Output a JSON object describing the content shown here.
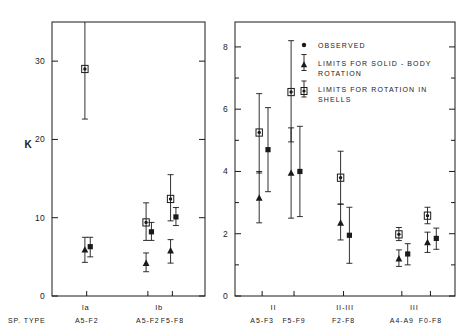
{
  "figure": {
    "y_axis_title": "K",
    "sp_type_label": "SP. TYPE"
  },
  "legend": {
    "entries": [
      {
        "marker": "observed-dot-icon",
        "label": "OBSERVED"
      },
      {
        "marker": "triangle-icon",
        "label": "LIMITS FOR SOLID - BODY"
      },
      {
        "marker": "",
        "label": "ROTATION"
      },
      {
        "marker": "circle-dot-icon",
        "label": "LIMITS FOR ROTATION  IN"
      },
      {
        "marker": "",
        "label": "SHELLS"
      }
    ]
  },
  "chart_data": [
    {
      "type": "scatter",
      "panel": "left",
      "title": "",
      "xlabel": "SP. TYPE",
      "ylabel": "K",
      "ylim": [
        0,
        35
      ],
      "yticks": [
        0,
        10,
        20,
        30
      ],
      "ytick_labels": [
        "0",
        "10",
        "20",
        "30"
      ],
      "grid": false,
      "legend_position": "none",
      "luminosity_groups": [
        {
          "name": "Ia",
          "x_center": 0.22,
          "spectral_ranges": [
            "A5-F2"
          ]
        },
        {
          "name": "Ib",
          "x_center": 0.7,
          "spectral_ranges": [
            "A5-F2",
            "F5-F8"
          ]
        }
      ],
      "series": [
        {
          "name": "LIMITS FOR ROTATION IN SHELLS",
          "marker": "circle-dot",
          "points": [
            {
              "group": "Ia",
              "sp": "A5-F2",
              "x": 0.215,
              "y": 29.0,
              "lo": 22.6,
              "hi": 35.0
            },
            {
              "group": "Ib",
              "sp": "A5-F2",
              "x": 0.615,
              "y": 9.4,
              "lo": 7.1,
              "hi": 11.9
            },
            {
              "group": "Ib",
              "sp": "F5-F8",
              "x": 0.775,
              "y": 12.4,
              "lo": 9.6,
              "hi": 15.5
            }
          ]
        },
        {
          "name": "OBSERVED",
          "marker": "filled-square",
          "points": [
            {
              "group": "Ia",
              "sp": "A5-F2",
              "x": 0.25,
              "y": 6.3,
              "lo": 5.0,
              "hi": 7.5
            },
            {
              "group": "Ib",
              "sp": "A5-F2",
              "x": 0.65,
              "y": 8.2,
              "lo": 7.1,
              "hi": 9.4
            },
            {
              "group": "Ib",
              "sp": "F5-F8",
              "x": 0.81,
              "y": 10.1,
              "lo": 9.0,
              "hi": 11.3
            }
          ]
        },
        {
          "name": "LIMITS FOR SOLID-BODY ROTATION",
          "marker": "triangle",
          "points": [
            {
              "group": "Ia",
              "sp": "A5-F2",
              "x": 0.215,
              "y": 5.9,
              "lo": 4.3,
              "hi": 7.5
            },
            {
              "group": "Ib",
              "sp": "A5-F2",
              "x": 0.615,
              "y": 4.2,
              "lo": 3.1,
              "hi": 5.5
            },
            {
              "group": "Ib",
              "sp": "F5-F8",
              "x": 0.775,
              "y": 5.8,
              "lo": 4.2,
              "hi": 7.2
            }
          ]
        }
      ]
    },
    {
      "type": "scatter",
      "panel": "right",
      "title": "",
      "xlabel": "SP. TYPE",
      "ylabel": "",
      "ylim": [
        0,
        8.8
      ],
      "yticks": [
        0,
        2,
        4,
        6,
        8
      ],
      "ytick_labels": [
        "0",
        "2",
        "4",
        "6",
        "8"
      ],
      "minor_yticks": [
        1,
        3,
        5,
        7
      ],
      "grid": false,
      "legend_position": "top-right",
      "luminosity_groups": [
        {
          "name": "II",
          "x_center": 0.175,
          "spectral_ranges": [
            "A5-F3",
            "F5-F9"
          ]
        },
        {
          "name": "II-III",
          "x_center": 0.5,
          "spectral_ranges": [
            "F2-F8"
          ]
        },
        {
          "name": "III",
          "x_center": 0.815,
          "spectral_ranges": [
            "A4-A9",
            "F0-F8"
          ]
        }
      ],
      "series": [
        {
          "name": "LIMITS FOR ROTATION IN SHELLS",
          "marker": "circle-dot",
          "points": [
            {
              "group": "II",
              "sp": "A5-F3",
              "x": 0.11,
              "y": 5.25,
              "lo": 3.95,
              "hi": 6.5
            },
            {
              "group": "II",
              "sp": "F5-F9",
              "x": 0.255,
              "y": 6.55,
              "lo": 4.95,
              "hi": 8.2
            },
            {
              "group": "II-III",
              "sp": "F2-F8",
              "x": 0.48,
              "y": 3.8,
              "lo": 2.95,
              "hi": 4.65
            },
            {
              "group": "III",
              "sp": "A4-A9",
              "x": 0.745,
              "y": 1.98,
              "lo": 1.78,
              "hi": 2.2
            },
            {
              "group": "III",
              "sp": "F0-F8",
              "x": 0.875,
              "y": 2.58,
              "lo": 2.32,
              "hi": 2.85
            }
          ]
        },
        {
          "name": "OBSERVED",
          "marker": "filled-square",
          "points": [
            {
              "group": "II",
              "sp": "A5-F3",
              "x": 0.15,
              "y": 4.7,
              "lo": 3.35,
              "hi": 6.05
            },
            {
              "group": "II",
              "sp": "F5-F9",
              "x": 0.295,
              "y": 4.0,
              "lo": 2.55,
              "hi": 5.45
            },
            {
              "group": "II-III",
              "sp": "F2-F8",
              "x": 0.52,
              "y": 1.95,
              "lo": 1.05,
              "hi": 2.85
            },
            {
              "group": "III",
              "sp": "A4-A9",
              "x": 0.785,
              "y": 1.35,
              "lo": 1.0,
              "hi": 1.68
            },
            {
              "group": "III",
              "sp": "F0-F8",
              "x": 0.915,
              "y": 1.85,
              "lo": 1.5,
              "hi": 2.18
            }
          ]
        },
        {
          "name": "LIMITS FOR SOLID-BODY ROTATION",
          "marker": "triangle",
          "points": [
            {
              "group": "II",
              "sp": "A5-F3",
              "x": 0.11,
              "y": 3.15,
              "lo": 2.35,
              "hi": 4.0
            },
            {
              "group": "II",
              "sp": "F5-F9",
              "x": 0.255,
              "y": 3.95,
              "lo": 2.5,
              "hi": 5.4
            },
            {
              "group": "II-III",
              "sp": "F2-F8",
              "x": 0.48,
              "y": 2.35,
              "lo": 1.8,
              "hi": 2.95
            },
            {
              "group": "III",
              "sp": "A4-A9",
              "x": 0.745,
              "y": 1.2,
              "lo": 0.95,
              "hi": 1.48
            },
            {
              "group": "III",
              "sp": "F0-F8",
              "x": 0.875,
              "y": 1.72,
              "lo": 1.4,
              "hi": 2.05
            }
          ]
        }
      ]
    }
  ]
}
